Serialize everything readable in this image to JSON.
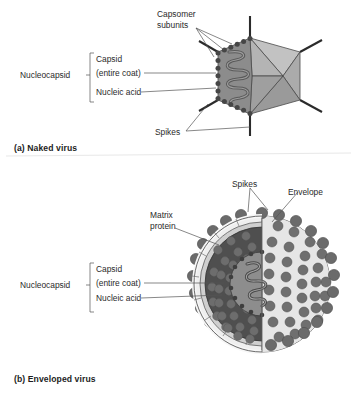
{
  "figure": {
    "title_visible": false,
    "background": "#ffffff"
  },
  "panel_a": {
    "caption": "(a) Naked virus",
    "labels": {
      "capsomer_line1": "Capsomer",
      "capsomer_line2": "subunits",
      "nucleocapsid": "Nucleocapsid",
      "capsid_line1": "Capsid",
      "capsid_line2": "(entire coat)",
      "nucleic_acid": "Nucleic acid",
      "spikes": "Spikes"
    },
    "colors": {
      "facet_light": "#b9b9b9",
      "facet_mid": "#a3a3a3",
      "facet_dark": "#8f8f8f",
      "interior": "#8a8a8a",
      "capsomer_bead": "#4a4a4a",
      "spike_line": "#2b2b2b",
      "nucleic_acid_strand": "#4f4f4f"
    }
  },
  "panel_b": {
    "caption": "(b) Enveloped virus",
    "labels": {
      "spikes": "Spikes",
      "envelope": "Envelope",
      "matrix_line1": "Matrix",
      "matrix_line2": "protein",
      "nucleocapsid": "Nucleocapsid",
      "capsid_line1": "Capsid",
      "capsid_line2": "(entire coat)",
      "nucleic_acid": "Nucleic acid"
    },
    "colors": {
      "envelope_outer": "#e3e3e3",
      "envelope_band": "#efefef",
      "spike_knob": "#6e6e6e",
      "spike_knob_dark": "#5a5a5a",
      "capsid_dark": "#4d4d4d",
      "capsid_subunit": "#6a6a6a",
      "core": "#8d8d8d",
      "nucleic_acid_strand": "#3f3f3f",
      "matrix_layer": "#d8d8d8"
    }
  }
}
